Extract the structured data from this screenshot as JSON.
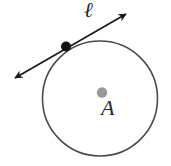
{
  "figure": {
    "background_color": "#ffffff",
    "width": 171,
    "height": 166
  },
  "labels": {
    "line_label": "ℓ",
    "center_label": "A"
  },
  "colors": {
    "circle_stroke": "#4a4a4a",
    "line_stroke": "#1a1a1a",
    "tangent_point_fill": "#111111",
    "center_point_fill": "#999999",
    "label_text": "#262626"
  },
  "geometry": {
    "circle": {
      "name": "circle-A",
      "cx": 100,
      "cy": 98.5,
      "r": 57.5,
      "stroke_width": 1.6
    },
    "center_point": {
      "name": "center-point-A",
      "cx": 102,
      "cy": 92.5,
      "r": 5.2
    },
    "tangent_point": {
      "name": "tangent-point",
      "cx": 66,
      "cy": 46.5,
      "r": 5.0
    },
    "tangent_line": {
      "name": "tangent-line-ell",
      "x1": 15,
      "y1": 78,
      "x2": 126,
      "y2": 14,
      "stroke_width": 1.7,
      "arrow_both_ends": true
    }
  },
  "chart_data": {
    "type": "diagram",
    "elements": [
      {
        "kind": "circle",
        "label": "A",
        "center": [
          100,
          98.5
        ],
        "radius": 57.5
      },
      {
        "kind": "point",
        "label": "A",
        "position": [
          102,
          92.5
        ],
        "fill": "gray",
        "role": "center"
      },
      {
        "kind": "point",
        "label": "",
        "position": [
          66,
          46.5
        ],
        "fill": "black",
        "role": "point-of-tangency"
      },
      {
        "kind": "line",
        "label": "ℓ",
        "from": [
          15,
          78
        ],
        "to": [
          126,
          14
        ],
        "arrows": "both",
        "role": "tangent"
      }
    ]
  }
}
